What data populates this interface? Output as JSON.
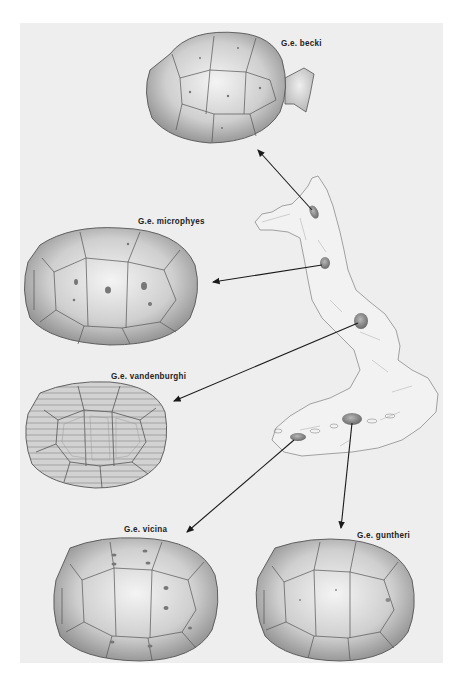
{
  "figure": {
    "background_color": "#ffffff",
    "panel_color": "#eeeeee",
    "ink_color": "#222222",
    "map": {
      "name": "island-map",
      "description": "Outline map of an elongated volcanic island with five shaded volcano locations"
    },
    "species": [
      {
        "id": "becki",
        "label": "G.e. becki",
        "shell_style": "saddleback, flared front"
      },
      {
        "id": "microphyes",
        "label": "G.e. microphyes",
        "shell_style": "domed, pitted scutes"
      },
      {
        "id": "vandenburghi",
        "label": "G.e. vandenburghi",
        "shell_style": "domed, concentric growth rings"
      },
      {
        "id": "vicina",
        "label": "G.e. vicina",
        "shell_style": "domed, pitted scutes"
      },
      {
        "id": "guntheri",
        "label": "G.e. guntheri",
        "shell_style": "domed, smooth scutes"
      }
    ],
    "arrows": [
      {
        "from": "volcano-becki",
        "to": "becki"
      },
      {
        "from": "volcano-microphyes",
        "to": "microphyes"
      },
      {
        "from": "volcano-vandenburghi",
        "to": "vandenburghi"
      },
      {
        "from": "volcano-vicina",
        "to": "vicina"
      },
      {
        "from": "volcano-guntheri",
        "to": "guntheri"
      }
    ]
  }
}
